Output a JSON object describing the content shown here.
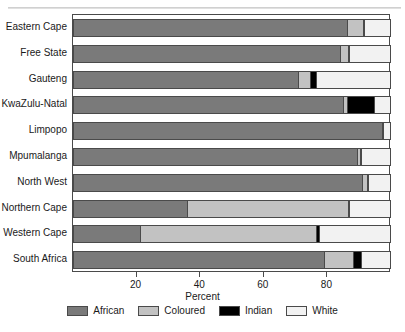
{
  "figure": {
    "top_clipped_text": "",
    "bottom_clipped_text": ""
  },
  "axis": {
    "xlabel": "Percent",
    "ticks": [
      {
        "value": 20,
        "label": "20"
      },
      {
        "value": 40,
        "label": "40"
      },
      {
        "value": 60,
        "label": "60"
      },
      {
        "value": 80,
        "label": "80"
      }
    ]
  },
  "legend": {
    "position": "bottom-center",
    "items": [
      {
        "label": "African",
        "color": "#7a7a7a"
      },
      {
        "label": "Coloured",
        "color": "#c2c2c2"
      },
      {
        "label": "Indian",
        "color": "#000000"
      },
      {
        "label": "White",
        "color": "#f2f2f2"
      }
    ]
  },
  "chart_data": {
    "type": "bar",
    "orientation": "horizontal",
    "stacked": true,
    "stack_total": 100,
    "title": "",
    "subtitle": "",
    "xlabel": "Percent",
    "ylabel": "",
    "xlim": [
      0,
      100
    ],
    "grid": false,
    "legend_position": "bottom-center",
    "categories": [
      "Eastern Cape",
      "Free State",
      "Gauteng",
      "KwaZulu-Natal",
      "Limpopo",
      "Mpumalanga",
      "North West",
      "Northern Cape",
      "Western Cape",
      "South Africa"
    ],
    "series": [
      {
        "name": "African",
        "color": "#7a7a7a",
        "values": [
          86.3,
          84.0,
          70.9,
          84.9,
          97.2,
          89.4,
          90.9,
          35.8,
          21.1,
          79.0
        ]
      },
      {
        "name": "Coloured",
        "color": "#c2c2c2",
        "values": [
          4.9,
          2.6,
          3.5,
          1.4,
          0.3,
          0.7,
          1.7,
          50.7,
          55.2,
          9.2
        ]
      },
      {
        "name": "Indian",
        "color": "#000000",
        "values": [
          0.3,
          0.1,
          2.0,
          8.5,
          0.1,
          0.4,
          0.3,
          0.3,
          1.1,
          2.3
        ]
      },
      {
        "name": "White",
        "color": "#f2f2f2",
        "values": [
          8.5,
          13.3,
          23.6,
          5.2,
          2.4,
          9.5,
          7.1,
          13.2,
          22.6,
          9.5
        ]
      }
    ]
  }
}
